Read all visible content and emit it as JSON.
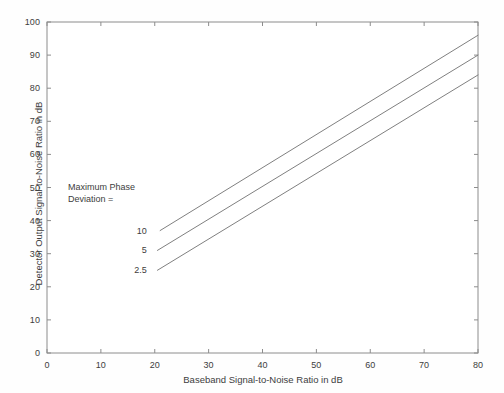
{
  "chart_data": {
    "type": "line",
    "title": "",
    "xlabel": "Baseband Signal-to-Noise Ratio in dB",
    "ylabel": "Detector Output Signal-to-Noise Ratio in dB",
    "xlim": [
      0,
      80
    ],
    "ylim": [
      0,
      100
    ],
    "xticks": [
      0,
      10,
      20,
      30,
      40,
      50,
      60,
      70,
      80
    ],
    "yticks": [
      0,
      10,
      20,
      30,
      40,
      50,
      60,
      70,
      80,
      90,
      100
    ],
    "xtick_labels": [
      "0",
      "10",
      "20",
      "30",
      "40",
      "50",
      "60",
      "70",
      "80"
    ],
    "ytick_labels": [
      "0",
      "10",
      "20",
      "30",
      "40",
      "50",
      "60",
      "70",
      "80",
      "90",
      "100"
    ],
    "grid": false,
    "legend_position": "inline-left-of-lines",
    "annotation": "Maximum Phase\nDeviation =",
    "series": [
      {
        "name": "10",
        "label": "10",
        "color": "#808080",
        "x": [
          21,
          80
        ],
        "y": [
          37,
          96
        ]
      },
      {
        "name": "5",
        "label": "5",
        "color": "#808080",
        "x": [
          20.5,
          80
        ],
        "y": [
          31,
          90
        ]
      },
      {
        "name": "2.5",
        "label": "2.5",
        "color": "#808080",
        "x": [
          20.5,
          80
        ],
        "y": [
          25,
          84
        ]
      }
    ]
  },
  "axes": {
    "frame_color": "#8c8c8c",
    "background": "#ffffff"
  },
  "series_label_positions": [
    {
      "label": "10",
      "x": 20,
      "y": 37
    },
    {
      "label": "5",
      "x": 20,
      "y": 31
    },
    {
      "label": "2.5",
      "x": 20,
      "y": 25
    }
  ]
}
